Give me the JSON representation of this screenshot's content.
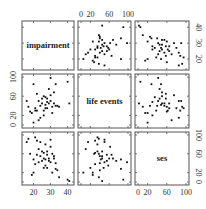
{
  "chart_data": {
    "type": "scatter",
    "title": "",
    "layout": "scatterplot-matrix 3x3",
    "variables": [
      "impairment",
      "life events",
      "ses"
    ],
    "ranges": {
      "impairment": [
        15,
        42
      ],
      "life events": [
        0,
        100
      ],
      "ses": [
        0,
        100
      ]
    },
    "ticks": {
      "impairment": [
        20,
        30,
        40
      ],
      "life events": [
        0,
        20,
        60,
        100
      ],
      "ses": [
        0,
        20,
        60,
        100
      ]
    },
    "axis_labels": {
      "top_life_events": [
        "0",
        "20",
        "60",
        "100"
      ],
      "right_impairment": [
        "20",
        "30",
        "40"
      ],
      "left_life_events": [
        "0",
        "20",
        "60",
        "100"
      ],
      "right_ses": [
        "0",
        "20",
        "60",
        "100"
      ],
      "bottom_impairment": [
        "20",
        "30",
        "40"
      ],
      "bottom_ses": [
        "0",
        "20",
        "60",
        "100"
      ]
    },
    "observations": [
      {
        "impairment": 41,
        "life events": 45,
        "ses": 2
      },
      {
        "impairment": 40,
        "life events": 90,
        "ses": 5
      },
      {
        "impairment": 30,
        "life events": 50,
        "ses": 90
      },
      {
        "impairment": 31,
        "life events": 38,
        "ses": 60
      },
      {
        "impairment": 32,
        "life events": 45,
        "ses": 55
      },
      {
        "impairment": 33,
        "life events": 40,
        "ses": 40
      },
      {
        "impairment": 28,
        "life events": 35,
        "ses": 65
      },
      {
        "impairment": 27,
        "life events": 42,
        "ses": 48
      },
      {
        "impairment": 26,
        "life events": 20,
        "ses": 30
      },
      {
        "impairment": 29,
        "life events": 45,
        "ses": 50
      },
      {
        "impairment": 24,
        "life events": 15,
        "ses": 85
      },
      {
        "impairment": 23,
        "life events": 10,
        "ses": 70
      },
      {
        "impairment": 22,
        "life events": 30,
        "ses": 88
      },
      {
        "impairment": 21,
        "life events": 35,
        "ses": 95
      },
      {
        "impairment": 20,
        "life events": 5,
        "ses": 20
      },
      {
        "impairment": 19,
        "life events": 25,
        "ses": 15
      },
      {
        "impairment": 18,
        "life events": 28,
        "ses": 60
      },
      {
        "impairment": 17,
        "life events": 38,
        "ses": 92
      },
      {
        "impairment": 16,
        "life events": 50,
        "ses": 85
      },
      {
        "impairment": 25,
        "life events": 55,
        "ses": 45
      },
      {
        "impairment": 26,
        "life events": 60,
        "ses": 50
      },
      {
        "impairment": 27,
        "life events": 58,
        "ses": 35
      },
      {
        "impairment": 28,
        "life events": 48,
        "ses": 30
      },
      {
        "impairment": 30,
        "life events": 62,
        "ses": 75
      },
      {
        "impairment": 32,
        "life events": 68,
        "ses": 50
      },
      {
        "impairment": 34,
        "life events": 40,
        "ses": 25
      },
      {
        "impairment": 35,
        "life events": 38,
        "ses": 10
      },
      {
        "impairment": 29,
        "life events": 75,
        "ses": 45
      },
      {
        "impairment": 25,
        "life events": 45,
        "ses": 65
      },
      {
        "impairment": 24,
        "life events": 40,
        "ses": 55
      },
      {
        "impairment": 23,
        "life events": 50,
        "ses": 42
      },
      {
        "impairment": 22,
        "life events": 65,
        "ses": 58
      },
      {
        "impairment": 21,
        "life events": 30,
        "ses": 38
      },
      {
        "impairment": 31,
        "life events": 25,
        "ses": 20
      },
      {
        "impairment": 33,
        "life events": 85,
        "ses": 28
      },
      {
        "impairment": 27,
        "life events": 35,
        "ses": 80
      },
      {
        "impairment": 20,
        "life events": 85,
        "ses": 48
      },
      {
        "impairment": 30,
        "life events": 98,
        "ses": 42
      },
      {
        "impairment": 26,
        "life events": 30,
        "ses": 62
      },
      {
        "impairment": 28,
        "life events": 55,
        "ses": 58
      }
    ],
    "grid": false,
    "legend": null
  },
  "labels": {
    "diag_0": "impairment",
    "diag_1": "life events",
    "diag_2": "ses"
  }
}
